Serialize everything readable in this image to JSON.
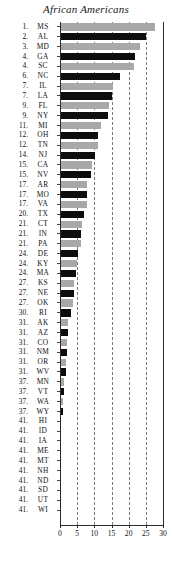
{
  "chart_data": {
    "type": "bar",
    "orientation": "horizontal",
    "title": "African Americans",
    "xlabel": "",
    "ylabel": "",
    "xlim": [
      0,
      30
    ],
    "xticks": [
      0,
      5,
      10,
      15,
      20,
      25,
      30
    ],
    "grid": true,
    "gridlines_at": [
      5,
      10,
      15,
      20,
      25
    ],
    "legend": "none",
    "bar_colors": {
      "odd": "#a8a8a8",
      "even": "#0d0d0d"
    },
    "categories": [
      "MS",
      "AL",
      "MD",
      "GA",
      "SC",
      "NC",
      "IL",
      "LA",
      "FL",
      "NY",
      "MI",
      "OH",
      "TN",
      "NJ",
      "CA",
      "NV",
      "AR",
      "MO",
      "VA",
      "TX",
      "CT",
      "IN",
      "PA",
      "DE",
      "KY",
      "MA",
      "KS",
      "NE",
      "OK",
      "RI",
      "AK",
      "AZ",
      "CO",
      "NM",
      "OR",
      "WV",
      "MN",
      "VT",
      "WA",
      "WY",
      "HI",
      "ID",
      "IA",
      "ME",
      "MT",
      "NH",
      "ND",
      "SD",
      "UT",
      "WI"
    ],
    "ranks": [
      "1.",
      "2.",
      "3.",
      "4.",
      "4.",
      "6.",
      "7.",
      "7.",
      "9.",
      "9.",
      "11.",
      "12.",
      "12.",
      "14.",
      "15.",
      "15.",
      "17.",
      "17.",
      "17.",
      "20.",
      "21.",
      "21.",
      "21.",
      "24.",
      "24.",
      "24.",
      "27.",
      "27.",
      "27.",
      "30.",
      "31.",
      "31.",
      "31.",
      "31.",
      "31.",
      "31.",
      "37.",
      "37.",
      "37.",
      "37.",
      "41.",
      "41.",
      "41.",
      "41.",
      "41.",
      "41.",
      "41.",
      "41.",
      "41.",
      "41."
    ],
    "values": [
      27.7,
      25.0,
      23.2,
      21.7,
      21.5,
      17.4,
      15.4,
      15.2,
      14.2,
      14.0,
      12.0,
      11.2,
      11.0,
      10.2,
      9.2,
      9.0,
      8.0,
      7.9,
      7.8,
      7.0,
      6.4,
      6.2,
      6.0,
      5.2,
      5.0,
      4.8,
      4.2,
      4.0,
      3.8,
      3.2,
      2.4,
      2.2,
      2.0,
      1.9,
      1.8,
      1.7,
      1.2,
      1.1,
      1.0,
      0.9,
      0.3,
      0.3,
      0.3,
      0.3,
      0.3,
      0.3,
      0.3,
      0.3,
      0.3,
      0.3
    ]
  },
  "axis": {
    "tick_labels": [
      "0",
      "5",
      "10",
      "15",
      "20",
      "25",
      "30"
    ]
  }
}
